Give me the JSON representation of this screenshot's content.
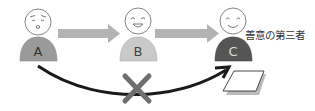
{
  "diagram": {
    "persons": [
      {
        "id": "A",
        "label": "A",
        "expression": "worried",
        "body_color": "#9a9a9a",
        "label_color": "#333333"
      },
      {
        "id": "B",
        "label": "B",
        "expression": "grinning",
        "body_color": "#c9c9c9",
        "label_color": "#444444"
      },
      {
        "id": "C",
        "label": "C",
        "expression": "smiling",
        "body_color": "#555555",
        "label_color": "#dddddd"
      }
    ],
    "third_party_label": "善意の第三者",
    "arrows": [
      {
        "from": "A",
        "to": "B",
        "style": "thick-gray",
        "color": "#b3b3b3"
      },
      {
        "from": "B",
        "to": "C",
        "style": "thick-gray",
        "color": "#b3b3b3"
      },
      {
        "from": "A",
        "to": "C",
        "style": "curved-black",
        "color": "#1a1a1a",
        "blocked": true
      }
    ],
    "blocked_mark": {
      "symbol": "cross-icon",
      "color": "#6e6e6e"
    },
    "document": {
      "symbol": "document-icon",
      "fill": "#ffffff",
      "stroke": "#333333",
      "shadow": "#bbbbbb"
    }
  }
}
